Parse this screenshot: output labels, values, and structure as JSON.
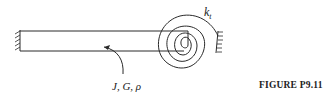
{
  "diagram": {
    "spring_label": {
      "symbol": "k",
      "subscript": "t"
    },
    "shaft_properties_label": "J, G, ρ",
    "caption": "FIGURE P9.11"
  }
}
